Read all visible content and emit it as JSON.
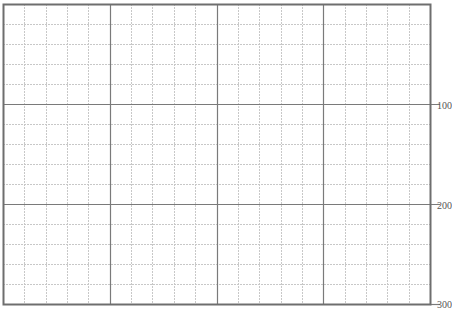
{
  "grid": {
    "left": 3,
    "top": 4,
    "width": 427,
    "height": 300,
    "major_cols": 4,
    "minor_per_major_col": 5,
    "major_rows": 3,
    "minor_per_major_row": 5,
    "colors": {
      "border": "#6e6e6e",
      "major": "#7a7a7a",
      "minor": "#c8c8c8"
    }
  },
  "y_axis": {
    "position": "right",
    "labels": [
      {
        "text": "100",
        "y": 105
      },
      {
        "text": "200",
        "y": 205
      },
      {
        "text": "300",
        "y": 304
      }
    ]
  }
}
